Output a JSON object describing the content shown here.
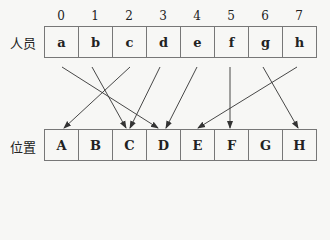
{
  "indices": [
    "0",
    "1",
    "2",
    "3",
    "4",
    "5",
    "6",
    "7"
  ],
  "top_row": {
    "label": "人员",
    "cells": [
      "a",
      "b",
      "c",
      "d",
      "e",
      "f",
      "g",
      "h"
    ]
  },
  "bottom_row": {
    "label": "位置",
    "cells": [
      "A",
      "B",
      "C",
      "D",
      "E",
      "F",
      "G",
      "H"
    ]
  },
  "mapping": [
    {
      "from": "a",
      "to": "D"
    },
    {
      "from": "b",
      "to": "C"
    },
    {
      "from": "c",
      "to": "A"
    },
    {
      "from": "d",
      "to": "C"
    },
    {
      "from": "e",
      "to": "D"
    },
    {
      "from": "f",
      "to": "F"
    },
    {
      "from": "g",
      "to": "H"
    },
    {
      "from": "h",
      "to": "E"
    }
  ]
}
